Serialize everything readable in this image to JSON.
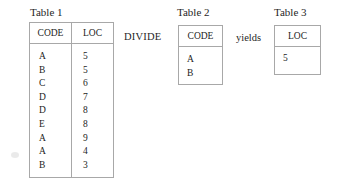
{
  "figure": {
    "operation": "DIVIDE",
    "background_color": "#ffffff",
    "border_color": "#a8a8a8",
    "text_color": "#1f1f1f"
  },
  "tables": {
    "table1": {
      "caption": "Table 1",
      "columns": [
        "CODE",
        "LOC"
      ],
      "rows": [
        [
          "A",
          "5"
        ],
        [
          "B",
          "5"
        ],
        [
          "C",
          "6"
        ],
        [
          "D",
          "7"
        ],
        [
          "D",
          "8"
        ],
        [
          "E",
          "8"
        ],
        [
          "A",
          "9"
        ],
        [
          "A",
          "4"
        ],
        [
          "B",
          "3"
        ]
      ]
    },
    "table2": {
      "caption": "Table 2",
      "columns": [
        "CODE"
      ],
      "rows": [
        [
          "A"
        ],
        [
          "B"
        ]
      ]
    },
    "table3": {
      "caption": "Table 3",
      "columns": [
        "LOC"
      ],
      "rows": [
        [
          "5"
        ]
      ]
    }
  },
  "operators": {
    "divide": "DIVIDE",
    "yields": "yields"
  }
}
